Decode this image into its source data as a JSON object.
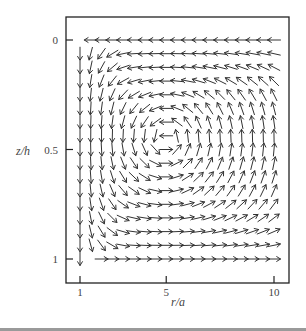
{
  "chart_data": {
    "type": "vector_field",
    "title": "",
    "xlabel": "r/a",
    "ylabel": "z/h",
    "xticks": [
      {
        "value": 1,
        "label": "1"
      },
      {
        "value": 5,
        "label": "5"
      },
      {
        "value": 10,
        "label": "10"
      }
    ],
    "yticks": [
      {
        "value": 0,
        "label": "0"
      },
      {
        "value": 0.5,
        "label": "0.5"
      },
      {
        "value": 1,
        "label": "1"
      }
    ],
    "xlim": [
      0.6,
      11.1
    ],
    "ylim_inverted": [
      -0.2,
      1.12
    ],
    "grid": false,
    "legend": null,
    "grid_x": [
      1.0,
      1.5,
      2.0,
      2.5,
      3.0,
      3.5,
      4.0,
      4.5,
      5.0,
      5.5,
      6.0,
      6.5,
      7.0,
      7.5,
      8.0,
      8.5,
      9.0,
      9.5,
      10.0
    ],
    "grid_z": [
      0,
      0.0625,
      0.125,
      0.1875,
      0.25,
      0.3125,
      0.375,
      0.4375,
      0.5,
      0.5625,
      0.625,
      0.6875,
      0.75,
      0.8125,
      0.875,
      0.9375,
      1.0
    ],
    "vortex_center": {
      "r": 5.0,
      "z": 0.45
    },
    "style": {
      "frame_color": "#222222",
      "arrow_color": "#333333",
      "label_color": "#444444"
    }
  },
  "axes": {
    "xlabel": "r/a",
    "ylabel": "z/h"
  }
}
